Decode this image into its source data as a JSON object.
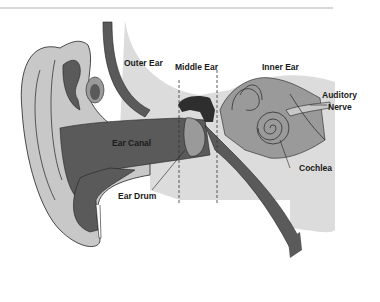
{
  "diagram": {
    "labels": {
      "outer_ear": "Outer Ear",
      "middle_ear": "Middle Ear",
      "inner_ear": "Inner Ear",
      "auditory_line1": "Auditory",
      "auditory_line2": "Nerve",
      "ear_canal": "Ear Canal",
      "ear_drum": "Ear Drum",
      "cochlea": "Cochlea"
    },
    "colors": {
      "light_tissue": "#c8c8c8",
      "mid_tissue": "#9a9a9a",
      "dark_tissue": "#5a5a5a",
      "darkest": "#2e2e2e",
      "background_panel": "#dcdcdc",
      "rule": "#b0b0b0",
      "outline": "#222222"
    }
  }
}
